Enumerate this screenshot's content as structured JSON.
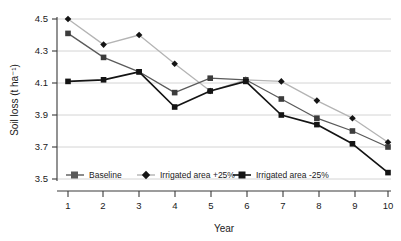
{
  "chart_data": {
    "type": "line",
    "title": "",
    "xlabel": "Year",
    "ylabel": "Soil loss (t ha⁻¹)",
    "categories": [
      1,
      2,
      3,
      4,
      5,
      6,
      7,
      8,
      9,
      10
    ],
    "x_tick_labels": [
      "1",
      "2",
      "3",
      "4",
      "5",
      "6",
      "7",
      "8",
      "9",
      "10"
    ],
    "y_tick_labels": [
      "3.5",
      "3.7",
      "3.9",
      "4.1",
      "4.3",
      "4.5"
    ],
    "y_ticks": [
      3.5,
      3.7,
      3.9,
      4.1,
      4.3,
      4.5
    ],
    "ylim": [
      3.5,
      4.5
    ],
    "xlim": [
      1,
      10
    ],
    "grid": "horizontal",
    "legend_position": "inside-bottom-left",
    "series": [
      {
        "name": "Baseline",
        "marker": "square",
        "color": "#5a5a5a",
        "values": [
          4.41,
          4.26,
          4.17,
          4.04,
          4.13,
          4.12,
          4.0,
          3.88,
          3.8,
          3.7
        ]
      },
      {
        "name": "Irrigated area +25%",
        "marker": "diamond",
        "color": "#b4b4b4",
        "values": [
          4.5,
          4.34,
          4.4,
          4.22,
          4.05,
          4.12,
          4.11,
          3.99,
          3.88,
          3.73
        ]
      },
      {
        "name": "Irrigated area -25%",
        "marker": "square",
        "color": "#141414",
        "values": [
          4.11,
          4.12,
          4.17,
          3.95,
          4.05,
          4.11,
          3.9,
          3.84,
          3.72,
          3.54
        ]
      }
    ]
  },
  "axis": {
    "x_title": "Year",
    "y_title": "Soil loss (t ha⁻¹)"
  },
  "legend": {
    "items": [
      {
        "label": "Baseline"
      },
      {
        "label": "Irrigated area +25%"
      },
      {
        "label": "Irrigated area -25%"
      }
    ]
  },
  "yticks": {
    "t0": "3.5",
    "t1": "3.7",
    "t2": "3.9",
    "t3": "4.1",
    "t4": "4.3",
    "t5": "4.5"
  },
  "xticks": {
    "t0": "1",
    "t1": "2",
    "t2": "3",
    "t3": "4",
    "t4": "5",
    "t5": "6",
    "t6": "7",
    "t7": "8",
    "t8": "9",
    "t9": "10"
  }
}
